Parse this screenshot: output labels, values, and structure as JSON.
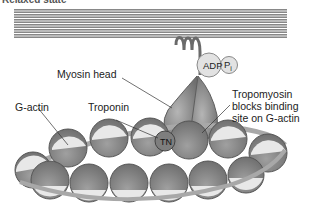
{
  "title": "Relaxed state",
  "labels": {
    "myosin_head": "Myosin head",
    "adp": "ADP",
    "pi": "P",
    "pi_sub": "i",
    "g_actin": "G-actin",
    "troponin": "Troponin",
    "tn": "TN",
    "tropomyosin_line1": "Tropomyosin",
    "tropomyosin_line2": "blocks binding",
    "tropomyosin_line3": "site on G-actin"
  },
  "colors": {
    "thick_filament": "#8a8a8a",
    "myosin": "#8c8c8c",
    "actin_dark": "#8f8f8f",
    "actin_light": "#e6e6e6",
    "tropomyosin": "#b0b0b0"
  }
}
